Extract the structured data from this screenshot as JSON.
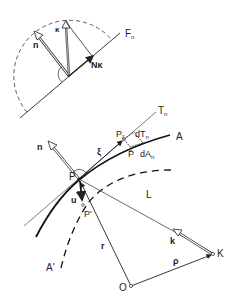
{
  "diagram": {
    "type": "vector-geometry",
    "top_inset": {
      "plane_label": "F",
      "plane_label_sub": "n",
      "normal_label": "n",
      "curvature_label": "κ",
      "normal_curvature_label": "Nκ"
    },
    "main": {
      "tangent_plane_label": "T",
      "tangent_plane_sub": "n",
      "curve_label": "A",
      "deformed_curve_label": "A'",
      "point_label": "P",
      "point_xi_label": "P",
      "point_xi_sub": "ξ",
      "dT_label": "dT",
      "dT_sub": "n",
      "dA_label": "dA",
      "dA_sub": "n",
      "pbar_label": "P̄",
      "xi_label": "ξ",
      "normal_label": "n",
      "displacement_label": "u",
      "displaced_point_label": "P'",
      "line_label": "L",
      "k_label": "k",
      "K_label": "K",
      "origin_label": "O",
      "r_label": "r",
      "rho_label": "ρ"
    },
    "colors": {
      "ink": "#222222",
      "light_ink": "#555555",
      "background": "#ffffff"
    }
  }
}
